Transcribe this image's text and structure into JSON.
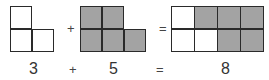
{
  "equation": {
    "left_count": "3",
    "plus": "+",
    "right_count": "5",
    "equals": "=",
    "total": "8"
  },
  "shapes": {
    "left": {
      "cells": 3,
      "color": "#ffffff"
    },
    "right": {
      "cells": 5,
      "color": "#a3a3a3"
    },
    "result": {
      "white_cells": 3,
      "gray_cells": 5
    }
  }
}
